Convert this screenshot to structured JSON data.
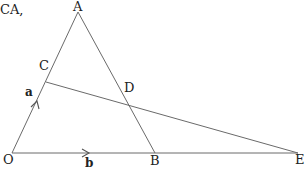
{
  "caption": "CA,",
  "points": {
    "O": {
      "label": "O",
      "x": 12,
      "y": 153
    },
    "A": {
      "label": "A",
      "x": 78,
      "y": 12
    },
    "B": {
      "label": "B",
      "x": 155,
      "y": 153
    },
    "C": {
      "label": "C",
      "x": 46,
      "y": 82
    },
    "D": {
      "label": "D",
      "x": 129,
      "y": 104
    },
    "E": {
      "label": "E",
      "x": 298,
      "y": 153
    }
  },
  "segments": [
    {
      "from": "O",
      "to": "A"
    },
    {
      "from": "A",
      "to": "B"
    },
    {
      "from": "O",
      "to": "E"
    },
    {
      "from": "C",
      "to": "E"
    }
  ],
  "vectors": {
    "a": {
      "label": "a",
      "on": "OA"
    },
    "b": {
      "label": "b",
      "on": "OB"
    }
  },
  "colors": {
    "line": "#6a6a6a",
    "text": "#222222",
    "background": "#ffffff"
  }
}
